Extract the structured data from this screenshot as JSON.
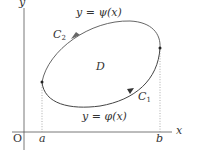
{
  "diagram": {
    "axes": {
      "x_label": "x",
      "y_label": "y",
      "origin_label": "O"
    },
    "region_label": "D",
    "curves": {
      "upper": {
        "equation": "y = ψ(x)",
        "name": "C",
        "subscript": "2"
      },
      "lower": {
        "equation": "y = φ(x)",
        "name": "C",
        "subscript": "1"
      }
    },
    "x_marks": {
      "left": "a",
      "right": "b"
    },
    "colors": {
      "axis": "#555555",
      "curve": "#555555",
      "dotted": "#888888",
      "text": "#333333"
    }
  }
}
